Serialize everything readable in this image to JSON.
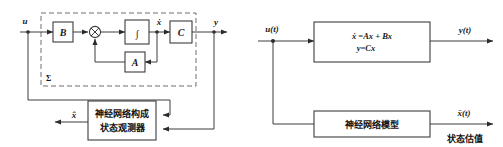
{
  "figure": {
    "type": "block-diagram-pair",
    "background_color": "#ffffff",
    "line_color": "#3c3c3c",
    "dashed_color": "#6e6e6e",
    "text_color": "#1a1a1a"
  },
  "left_diagram": {
    "title": "state observer built from neural network",
    "dashed_group_label": "Σ",
    "signals": {
      "input": "u",
      "state": "ẋ",
      "output": "y",
      "estimate": "x̂"
    },
    "blocks": [
      {
        "id": "B",
        "label": "B"
      },
      {
        "id": "integrator",
        "label": "∫"
      },
      {
        "id": "A",
        "label": "A"
      },
      {
        "id": "C",
        "label": "C"
      }
    ],
    "summing_junction": {
      "symbol": "⊗"
    },
    "observer_block": {
      "line1": "神经网络构成",
      "line2": "状态观测器"
    }
  },
  "right_diagram": {
    "title": "plant model with neural network estimator",
    "signals": {
      "input": "u(t)",
      "output": "y(t)",
      "estimate": "x̄(t)"
    },
    "plant_block": {
      "equation1": "ẋ =Ax + Bx",
      "equation2": "y=Cx"
    },
    "nn_block": {
      "label": "神经网络模型"
    },
    "estimate_caption": "状态估值"
  }
}
